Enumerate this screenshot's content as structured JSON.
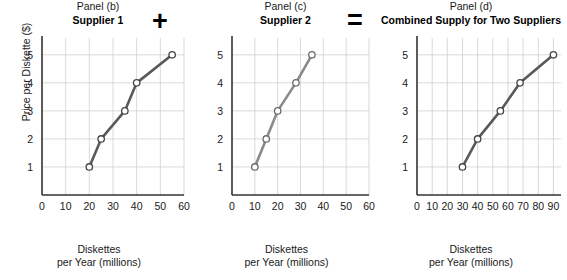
{
  "figure": {
    "operators": {
      "plus": "+",
      "equals": "="
    },
    "axis_labels": {
      "y": "Price per Diskette ($)",
      "x_line1": "Diskettes",
      "x_line2": "per Year (millions)"
    }
  },
  "panels": [
    {
      "id": "b",
      "label": "Panel (b)",
      "title": "Supplier 1",
      "line_color": "#595959",
      "marker_fill": "#ffffff",
      "marker_stroke": "#444444"
    },
    {
      "id": "c",
      "label": "Panel (c)",
      "title": "Supplier 2",
      "line_color": "#8a8a8a",
      "marker_fill": "#ffffff",
      "marker_stroke": "#6b6b6b"
    },
    {
      "id": "d",
      "label": "Panel (d)",
      "title": "Combined Supply for Two Suppliers",
      "line_color": "#595959",
      "marker_fill": "#ffffff",
      "marker_stroke": "#444444"
    }
  ],
  "chart_data": [
    {
      "type": "line",
      "title": "Supplier 1",
      "subtitle": "Panel (b)",
      "xlabel": "Diskettes per Year (millions)",
      "ylabel": "Price per Diskette ($)",
      "xlim": [
        0,
        60
      ],
      "ylim": [
        0,
        5.6
      ],
      "xticks": [
        0,
        10,
        20,
        30,
        40,
        50,
        60
      ],
      "yticks": [
        1,
        2,
        3,
        4,
        5
      ],
      "grid": true,
      "legend": "none",
      "x": [
        20,
        25,
        35,
        40,
        55
      ],
      "y": [
        1,
        2,
        3,
        4,
        5
      ],
      "series": [
        {
          "name": "Supplier 1 supply",
          "x": [
            20,
            25,
            35,
            40,
            55
          ],
          "values": [
            1,
            2,
            3,
            4,
            5
          ]
        }
      ]
    },
    {
      "type": "line",
      "title": "Supplier 2",
      "subtitle": "Panel (c)",
      "xlabel": "Diskettes per Year (millions)",
      "ylabel": "Price per Diskette ($)",
      "xlim": [
        0,
        60
      ],
      "ylim": [
        0,
        5.6
      ],
      "xticks": [
        0,
        10,
        20,
        30,
        40,
        50,
        60
      ],
      "yticks": [
        1,
        2,
        3,
        4,
        5
      ],
      "grid": true,
      "legend": "none",
      "x": [
        10,
        15,
        20,
        28,
        35
      ],
      "y": [
        1,
        2,
        3,
        4,
        5
      ],
      "series": [
        {
          "name": "Supplier 2 supply",
          "x": [
            10,
            15,
            20,
            28,
            35
          ],
          "values": [
            1,
            2,
            3,
            4,
            5
          ]
        }
      ]
    },
    {
      "type": "line",
      "title": "Combined Supply for Two Suppliers",
      "subtitle": "Panel (d)",
      "xlabel": "Diskettes per Year (millions)",
      "ylabel": "Price per Diskette ($)",
      "xlim": [
        0,
        95
      ],
      "ylim": [
        0,
        5.6
      ],
      "xticks": [
        0,
        10,
        20,
        30,
        40,
        50,
        60,
        70,
        80,
        90
      ],
      "yticks": [
        1,
        2,
        3,
        4,
        5
      ],
      "grid": true,
      "legend": "none",
      "x": [
        30,
        40,
        55,
        68,
        90
      ],
      "y": [
        1,
        2,
        3,
        4,
        5
      ],
      "series": [
        {
          "name": "Combined supply",
          "x": [
            30,
            40,
            55,
            68,
            90
          ],
          "values": [
            1,
            2,
            3,
            4,
            5
          ]
        }
      ]
    }
  ]
}
